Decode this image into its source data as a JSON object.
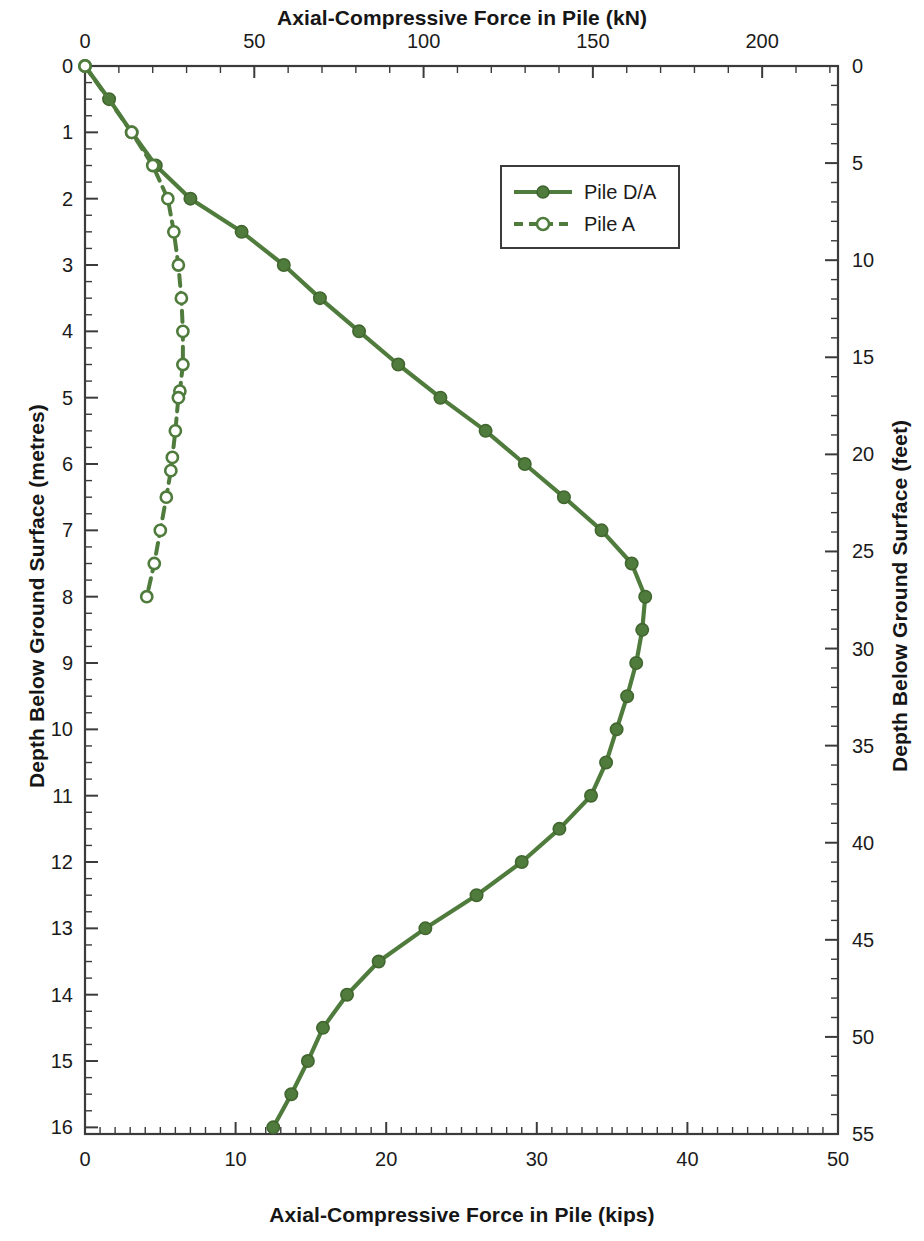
{
  "chart_data": {
    "type": "line",
    "title": "",
    "orientation": "depth-profile",
    "top_axis": {
      "label": "Axial-Compressive Force in Pile (kN)",
      "ticks": [
        0,
        50,
        100,
        150,
        200
      ],
      "range": [
        0,
        222.4
      ],
      "minor_tick_step": 10
    },
    "bottom_axis": {
      "label": "Axial-Compressive Force in Pile (kips)",
      "ticks": [
        0,
        10,
        20,
        30,
        40,
        50
      ],
      "range": [
        0,
        50
      ],
      "minor_tick_step": 1
    },
    "left_axis": {
      "label": "Depth Below Ground Surface (metres)",
      "ticks": [
        0,
        1,
        2,
        3,
        4,
        5,
        6,
        7,
        8,
        9,
        10,
        11,
        12,
        13,
        14,
        15,
        16
      ],
      "range": [
        0,
        16.1
      ],
      "inverted": true,
      "minor_tick_step": 0.25
    },
    "right_axis": {
      "label": "Depth Below Ground Surface (feet)",
      "ticks": [
        0,
        5,
        10,
        15,
        20,
        25,
        30,
        35,
        40,
        45,
        50,
        55
      ],
      "range": [
        0,
        55
      ],
      "inverted": true,
      "minor_tick_step": 1
    },
    "grid": false,
    "legend_position": "upper-center",
    "series": [
      {
        "name": "Pile D/A",
        "color": "#4f7c3c",
        "line_style": "solid",
        "marker": "filled-circle",
        "x_units": "kips",
        "y_units": "metres",
        "points": [
          {
            "depth_m": 0.0,
            "force_kips": 0.0,
            "force_kN": 0.0
          },
          {
            "depth_m": 0.5,
            "force_kips": 1.6,
            "force_kN": 7.1
          },
          {
            "depth_m": 1.0,
            "force_kips": 3.1,
            "force_kN": 13.8
          },
          {
            "depth_m": 1.5,
            "force_kips": 4.7,
            "force_kN": 20.9
          },
          {
            "depth_m": 2.0,
            "force_kips": 7.0,
            "force_kN": 31.1
          },
          {
            "depth_m": 2.5,
            "force_kips": 10.4,
            "force_kN": 46.3
          },
          {
            "depth_m": 3.0,
            "force_kips": 13.2,
            "force_kN": 58.7
          },
          {
            "depth_m": 3.5,
            "force_kips": 15.6,
            "force_kN": 69.4
          },
          {
            "depth_m": 4.0,
            "force_kips": 18.2,
            "force_kN": 81.0
          },
          {
            "depth_m": 4.5,
            "force_kips": 20.8,
            "force_kN": 92.5
          },
          {
            "depth_m": 5.0,
            "force_kips": 23.6,
            "force_kN": 105.0
          },
          {
            "depth_m": 5.5,
            "force_kips": 26.6,
            "force_kN": 118.3
          },
          {
            "depth_m": 6.0,
            "force_kips": 29.2,
            "force_kN": 129.9
          },
          {
            "depth_m": 6.5,
            "force_kips": 31.8,
            "force_kN": 141.5
          },
          {
            "depth_m": 7.0,
            "force_kips": 34.3,
            "force_kN": 152.6
          },
          {
            "depth_m": 7.5,
            "force_kips": 36.3,
            "force_kN": 161.5
          },
          {
            "depth_m": 8.0,
            "force_kips": 37.2,
            "force_kN": 165.5
          },
          {
            "depth_m": 8.5,
            "force_kips": 37.0,
            "force_kN": 164.6
          },
          {
            "depth_m": 9.0,
            "force_kips": 36.6,
            "force_kN": 162.8
          },
          {
            "depth_m": 9.5,
            "force_kips": 36.0,
            "force_kN": 160.1
          },
          {
            "depth_m": 10.0,
            "force_kips": 35.3,
            "force_kN": 157.0
          },
          {
            "depth_m": 10.5,
            "force_kips": 34.6,
            "force_kN": 153.9
          },
          {
            "depth_m": 11.0,
            "force_kips": 33.6,
            "force_kN": 149.5
          },
          {
            "depth_m": 11.5,
            "force_kips": 31.5,
            "force_kN": 140.1
          },
          {
            "depth_m": 12.0,
            "force_kips": 29.0,
            "force_kN": 129.0
          },
          {
            "depth_m": 12.5,
            "force_kips": 26.0,
            "force_kN": 115.7
          },
          {
            "depth_m": 13.0,
            "force_kips": 22.6,
            "force_kN": 100.5
          },
          {
            "depth_m": 13.5,
            "force_kips": 19.5,
            "force_kN": 86.7
          },
          {
            "depth_m": 14.0,
            "force_kips": 17.4,
            "force_kN": 77.4
          },
          {
            "depth_m": 14.5,
            "force_kips": 15.8,
            "force_kN": 70.3
          },
          {
            "depth_m": 15.0,
            "force_kips": 14.8,
            "force_kN": 65.8
          },
          {
            "depth_m": 15.5,
            "force_kips": 13.7,
            "force_kN": 60.9
          },
          {
            "depth_m": 16.0,
            "force_kips": 12.5,
            "force_kN": 55.6
          }
        ]
      },
      {
        "name": "Pile A",
        "color": "#4f7c3c",
        "line_style": "dashed",
        "marker": "open-circle",
        "x_units": "kips",
        "y_units": "metres",
        "points": [
          {
            "depth_m": 0.0,
            "force_kips": 0.0,
            "force_kN": 0.0
          },
          {
            "depth_m": 1.0,
            "force_kips": 3.1,
            "force_kN": 13.8
          },
          {
            "depth_m": 1.5,
            "force_kips": 4.5,
            "force_kN": 20.0
          },
          {
            "depth_m": 2.0,
            "force_kips": 5.5,
            "force_kN": 24.5
          },
          {
            "depth_m": 2.5,
            "force_kips": 5.9,
            "force_kN": 26.2
          },
          {
            "depth_m": 3.0,
            "force_kips": 6.2,
            "force_kN": 27.6
          },
          {
            "depth_m": 3.5,
            "force_kips": 6.4,
            "force_kN": 28.5
          },
          {
            "depth_m": 4.0,
            "force_kips": 6.5,
            "force_kN": 28.9
          },
          {
            "depth_m": 4.5,
            "force_kips": 6.5,
            "force_kN": 28.9
          },
          {
            "depth_m": 4.9,
            "force_kips": 6.3,
            "force_kN": 28.0
          },
          {
            "depth_m": 5.0,
            "force_kips": 6.2,
            "force_kN": 27.6
          },
          {
            "depth_m": 5.5,
            "force_kips": 6.0,
            "force_kN": 26.7
          },
          {
            "depth_m": 5.9,
            "force_kips": 5.8,
            "force_kN": 25.8
          },
          {
            "depth_m": 6.1,
            "force_kips": 5.7,
            "force_kN": 25.4
          },
          {
            "depth_m": 6.5,
            "force_kips": 5.4,
            "force_kN": 24.0
          },
          {
            "depth_m": 7.0,
            "force_kips": 5.0,
            "force_kN": 22.2
          },
          {
            "depth_m": 7.5,
            "force_kips": 4.6,
            "force_kN": 20.5
          },
          {
            "depth_m": 8.0,
            "force_kips": 4.1,
            "force_kN": 18.2
          }
        ]
      }
    ]
  },
  "legend": {
    "entries": [
      {
        "label": "Pile D/A"
      },
      {
        "label": "Pile A"
      }
    ]
  },
  "axes": {
    "top_title": "Axial-Compressive Force in Pile (kN)",
    "bottom_title": "Axial-Compressive Force in Pile (kips)",
    "left_title": "Depth Below Ground Surface (metres)",
    "right_title": "Depth Below Ground Surface (feet)"
  },
  "colors": {
    "series": "#4f7c3c",
    "axis": "#3b3b3b",
    "text": "#1b1b1b"
  }
}
